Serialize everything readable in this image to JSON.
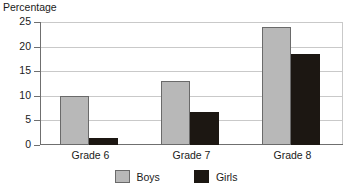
{
  "chart_data": {
    "type": "bar",
    "title": "Percentage",
    "xlabel": "",
    "ylabel": "",
    "ylim": [
      0,
      25
    ],
    "yticks": [
      0,
      5,
      10,
      15,
      20,
      25
    ],
    "ytick_labels": [
      "0",
      "5",
      "10",
      "15",
      "20",
      "25"
    ],
    "grid": true,
    "legend_position": "bottom-center",
    "categories": [
      "Grade 6",
      "Grade 7",
      "Grade 8"
    ],
    "series": [
      {
        "name": "Boys",
        "color": "#b8b8b8",
        "values": [
          10,
          13,
          24
        ]
      },
      {
        "name": "Girls",
        "color": "#1c1712",
        "values": [
          1.5,
          6.7,
          18.5
        ]
      }
    ]
  },
  "legend": {
    "items": [
      {
        "label": "Boys"
      },
      {
        "label": "Girls"
      }
    ]
  },
  "colors": {
    "boys": "#b8b8b8",
    "girls": "#1c1712",
    "grid": "#c9c9c9",
    "axis": "#6f6f6f",
    "text": "#1a1a1a",
    "background": "#ffffff"
  }
}
